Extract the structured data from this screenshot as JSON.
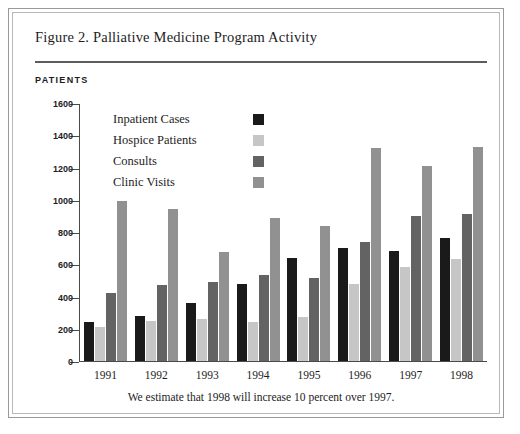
{
  "figure": {
    "title": "Figure 2. Palliative Medicine Program Activity",
    "axis_title": "PATIENTS",
    "caption": "We estimate that 1998 will increase 10 percent over 1997."
  },
  "colors": {
    "inpatient_cases": "#1a1a1a",
    "hospice_patients": "#c6c6c6",
    "consults": "#636363",
    "clinic_visits": "#919191",
    "axis": "#4a4a4a",
    "rule": "#5d5d5d",
    "frame_outer": "#9a9a9a",
    "frame_inner": "#b8b8b8",
    "text": "#1d1d1d"
  },
  "chart_data": {
    "type": "bar",
    "title": "Figure 2. Palliative Medicine Program Activity",
    "subtitle": "",
    "xlabel": "",
    "ylabel": "PATIENTS",
    "ylim": [
      0,
      1600
    ],
    "yticks": [
      0,
      200,
      400,
      600,
      800,
      1000,
      1200,
      1400,
      1600
    ],
    "ytick_labels": [
      "0",
      "200",
      "400",
      "600",
      "800",
      "1000",
      "1200",
      "1400",
      "1600"
    ],
    "grid": false,
    "legend_position": "inside-upper-left",
    "categories": [
      "1991",
      "1992",
      "1993",
      "1994",
      "1995",
      "1996",
      "1997",
      "1998"
    ],
    "series": [
      {
        "name": "Inpatient Cases",
        "color": "#1a1a1a",
        "values": [
          240,
          280,
          360,
          475,
          640,
          700,
          680,
          760
        ]
      },
      {
        "name": "Hospice Patients",
        "color": "#c6c6c6",
        "values": [
          210,
          250,
          260,
          240,
          275,
          480,
          580,
          630
        ]
      },
      {
        "name": "Consults",
        "color": "#636363",
        "values": [
          420,
          470,
          490,
          535,
          515,
          740,
          900,
          910
        ]
      },
      {
        "name": "Clinic Visits",
        "color": "#919191",
        "values": [
          995,
          940,
          675,
          890,
          840,
          1320,
          1210,
          1330
        ]
      }
    ],
    "annotation": "We estimate that 1998 will increase 10 percent over 1997."
  }
}
